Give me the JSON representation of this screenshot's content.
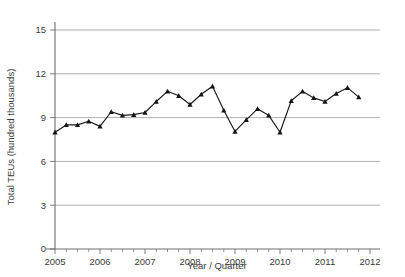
{
  "chart_data": {
    "type": "line",
    "title": "",
    "subtitle": "",
    "xlabel": "Year / Quarter",
    "ylabel": "Total TEUs (hundred thousands)",
    "xlim": [
      2005.0,
      2012.0
    ],
    "ylim": [
      0,
      15.8
    ],
    "grid": true,
    "legend": "none",
    "y_ticks": [
      "0",
      "3",
      "6",
      "9",
      "12",
      "15"
    ],
    "y_tick_values": [
      0,
      3,
      6,
      9,
      12,
      15
    ],
    "x_ticks": [
      "2005",
      "2006",
      "2007",
      "2008",
      "2009",
      "2010",
      "2011",
      "2012"
    ],
    "x_tick_values": [
      2005,
      2006,
      2007,
      2008,
      2009,
      2010,
      2011,
      2012
    ],
    "minor_x_ticks_per_year": 4,
    "marker": "filled-triangle",
    "line_color": "#1a1a1a",
    "marker_color": "#141414",
    "grid_color": "#9a9a9a",
    "axis_color": "#6e6e6e",
    "background_color": "#ffffff",
    "x": [
      2005.0,
      2005.25,
      2005.5,
      2005.75,
      2006.0,
      2006.25,
      2006.5,
      2006.75,
      2007.0,
      2007.25,
      2007.5,
      2007.75,
      2008.0,
      2008.25,
      2008.5,
      2008.75,
      2009.0,
      2009.25,
      2009.5,
      2009.75,
      2010.0,
      2010.25,
      2010.5,
      2010.75,
      2011.0,
      2011.25,
      2011.5,
      2011.75
    ],
    "categories": [
      "2005 Q1",
      "2005 Q2",
      "2005 Q3",
      "2005 Q4",
      "2006 Q1",
      "2006 Q2",
      "2006 Q3",
      "2006 Q4",
      "2007 Q1",
      "2007 Q2",
      "2007 Q3",
      "2007 Q4",
      "2008 Q1",
      "2008 Q2",
      "2008 Q3",
      "2008 Q4",
      "2009 Q1",
      "2009 Q2",
      "2009 Q3",
      "2009 Q4",
      "2010 Q1",
      "2010 Q2",
      "2010 Q3",
      "2010 Q4",
      "2011 Q1",
      "2011 Q2",
      "2011 Q3",
      "2011 Q4"
    ],
    "values": [
      8.0,
      8.5,
      8.5,
      8.75,
      8.4,
      9.4,
      9.15,
      9.2,
      9.35,
      10.1,
      10.8,
      10.5,
      9.9,
      10.6,
      11.15,
      9.5,
      8.05,
      8.85,
      9.6,
      9.15,
      8.0,
      10.15,
      10.8,
      10.35,
      10.1,
      10.65,
      11.05,
      10.4
    ],
    "series": [
      {
        "name": "Total TEUs",
        "values": [
          8.0,
          8.5,
          8.5,
          8.75,
          8.4,
          9.4,
          9.15,
          9.2,
          9.35,
          10.1,
          10.8,
          10.5,
          9.9,
          10.6,
          11.15,
          9.5,
          8.05,
          8.85,
          9.6,
          9.15,
          8.0,
          10.15,
          10.8,
          10.35,
          10.1,
          10.65,
          11.05,
          10.4
        ]
      }
    ]
  }
}
